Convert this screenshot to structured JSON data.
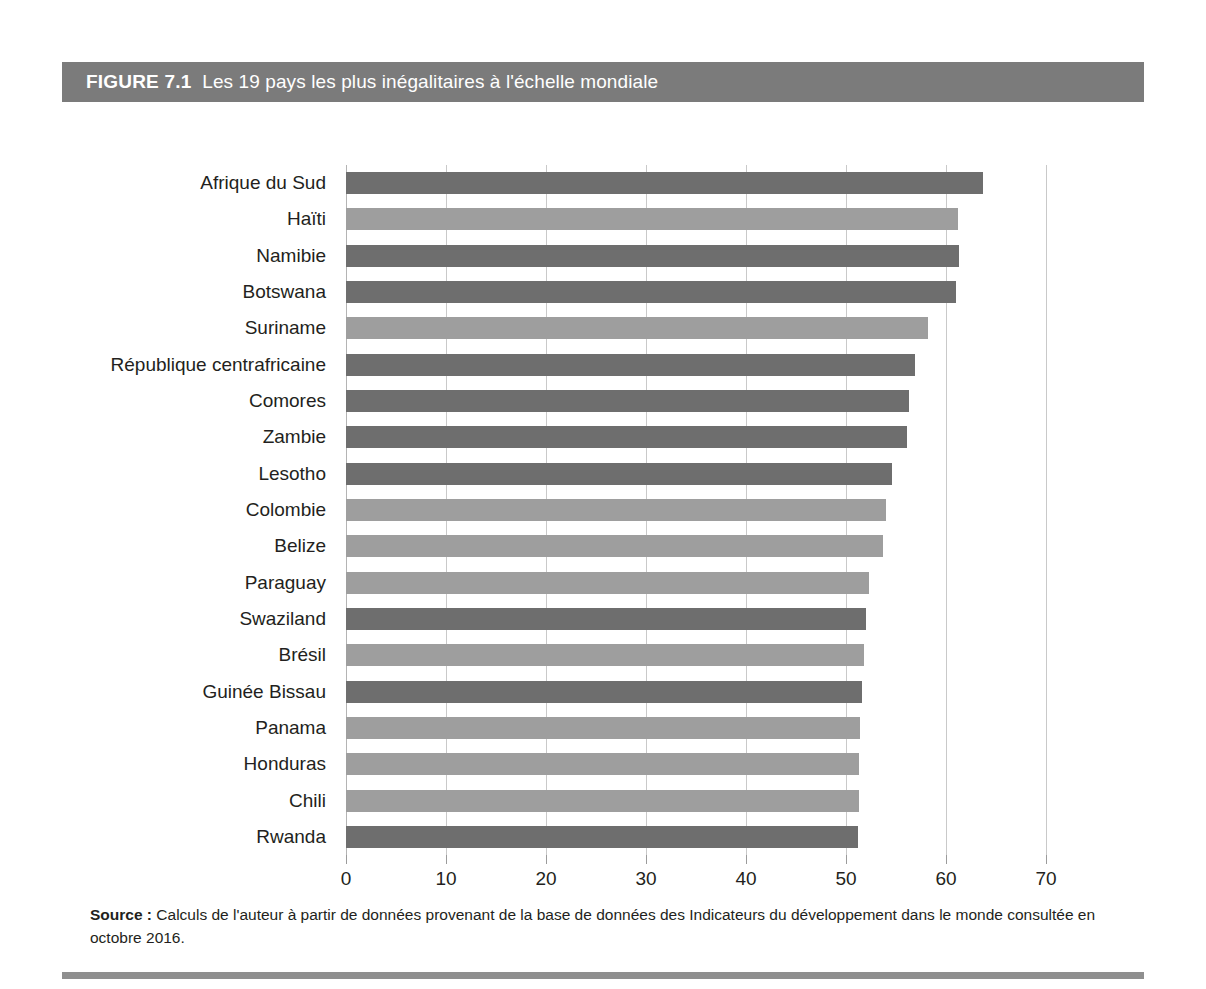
{
  "figure": {
    "number_label": "FIGURE 7.1",
    "title": "Les 19 pays les plus inégalitaires à l'échelle mondiale",
    "header_bg": "#7b7b7b",
    "header_text_color": "#ffffff"
  },
  "source": {
    "label": "Source :",
    "text": " Calculs de l'auteur à partir de données provenant de la base de données des Indicateurs du développement dans le monde consultée en octobre 2016."
  },
  "colors": {
    "bar_dark": "#6e6e6e",
    "bar_light": "#9e9e9e",
    "gridline": "#c9c9c9",
    "axis": "#b4b4b4",
    "text": "#231f20",
    "bottom_rule": "#8f8f8f"
  },
  "chart_data": {
    "type": "bar",
    "orientation": "horizontal",
    "title": "Les 19 pays les plus inégalitaires à l'échelle mondiale",
    "xlabel": "",
    "ylabel": "",
    "xlim": [
      0,
      70
    ],
    "xticks": [
      0,
      10,
      20,
      30,
      40,
      50,
      60,
      70
    ],
    "xticklabels": [
      "0",
      "10",
      "20",
      "30",
      "40",
      "50",
      "60",
      "70"
    ],
    "grid": true,
    "legend": false,
    "categories": [
      "Afrique du Sud",
      "Haïti",
      "Namibie",
      "Botswana",
      "Suriname",
      "République centrafricaine",
      "Comores",
      "Zambie",
      "Lesotho",
      "Colombie",
      "Belize",
      "Paraguay",
      "Swaziland",
      "Brésil",
      "Guinée Bissau",
      "Panama",
      "Honduras",
      "Chili",
      "Rwanda"
    ],
    "values": [
      63.7,
      61.2,
      61.3,
      61.0,
      58.2,
      56.9,
      56.3,
      56.1,
      54.6,
      54.0,
      53.7,
      52.3,
      52.0,
      51.8,
      51.6,
      51.4,
      51.3,
      51.3,
      51.2
    ],
    "bar_shades": [
      "dark",
      "light",
      "dark",
      "dark",
      "light",
      "dark",
      "dark",
      "dark",
      "dark",
      "light",
      "light",
      "light",
      "dark",
      "light",
      "dark",
      "light",
      "light",
      "light",
      "dark"
    ]
  }
}
